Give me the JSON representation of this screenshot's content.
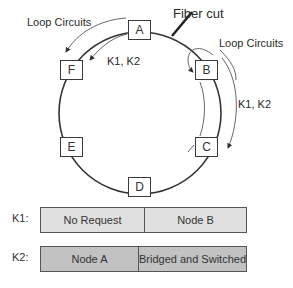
{
  "diagram": {
    "nodes": [
      {
        "id": "A",
        "label": "A"
      },
      {
        "id": "B",
        "label": "B"
      },
      {
        "id": "C",
        "label": "C"
      },
      {
        "id": "D",
        "label": "D"
      },
      {
        "id": "E",
        "label": "E"
      },
      {
        "id": "F",
        "label": "F"
      }
    ],
    "annotations": {
      "fiber_cut": "Fiber cut",
      "loop_circuits_left": "Loop Circuits",
      "loop_circuits_right": "Loop Circuits",
      "k1k2_left": "K1, K2",
      "k1k2_right": "K1, K2"
    },
    "bytes": [
      {
        "label": "K1:",
        "cells": [
          "No Request",
          "Node B"
        ]
      },
      {
        "label": "K2:",
        "cells": [
          "Node A",
          "Bridged and Switched"
        ]
      }
    ],
    "colors": {
      "ring_line": "#333333",
      "k1_fill": "#e0e0e0",
      "k2_fill": "#c2c2c2"
    }
  }
}
